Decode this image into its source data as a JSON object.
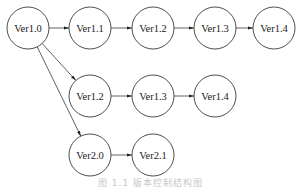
{
  "diagram": {
    "type": "version-tree",
    "nodes": [
      {
        "id": "n1",
        "label": "Ver1.0",
        "x": 28,
        "y": 28
      },
      {
        "id": "n2",
        "label": "Ver1.1",
        "x": 90,
        "y": 28
      },
      {
        "id": "n3",
        "label": "Ver1.2",
        "x": 153,
        "y": 28
      },
      {
        "id": "n4",
        "label": "Ver1.3",
        "x": 215,
        "y": 28
      },
      {
        "id": "n5",
        "label": "Ver1.4",
        "x": 274,
        "y": 28
      },
      {
        "id": "n6",
        "label": "Ver1.2",
        "x": 90,
        "y": 96
      },
      {
        "id": "n7",
        "label": "Ver1.3",
        "x": 153,
        "y": 96
      },
      {
        "id": "n8",
        "label": "Ver1.4",
        "x": 215,
        "y": 96
      },
      {
        "id": "n9",
        "label": "Ver2.0",
        "x": 90,
        "y": 155
      },
      {
        "id": "n10",
        "label": "Ver2.1",
        "x": 153,
        "y": 155
      }
    ],
    "edges": [
      {
        "from": "n1",
        "to": "n2"
      },
      {
        "from": "n2",
        "to": "n3"
      },
      {
        "from": "n3",
        "to": "n4"
      },
      {
        "from": "n4",
        "to": "n5"
      },
      {
        "from": "n1",
        "to": "n6"
      },
      {
        "from": "n6",
        "to": "n7"
      },
      {
        "from": "n7",
        "to": "n8"
      },
      {
        "from": "n1",
        "to": "n9"
      },
      {
        "from": "n9",
        "to": "n10"
      }
    ],
    "caption": "图 1.1  版本控制结构图"
  }
}
